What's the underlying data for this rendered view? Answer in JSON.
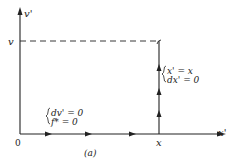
{
  "diagram": {
    "axes": {
      "y_label": "v'",
      "x_label": "x'",
      "origin_label": "0"
    },
    "ticks": {
      "y_tick_label": "v",
      "x_tick_label": "x"
    },
    "horizontal_path": {
      "condition_line1": "dv' = 0",
      "condition_line2": "f* = 0"
    },
    "vertical_path": {
      "condition_line1": "x' = x",
      "condition_line2": "dx' = 0"
    },
    "caption": "(a)",
    "colors": {
      "line": "#222222",
      "background": "#ffffff"
    }
  }
}
